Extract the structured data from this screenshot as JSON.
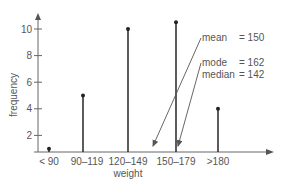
{
  "chart_data": {
    "type": "bar",
    "subtype": "stem",
    "title": "",
    "xlabel": "weight",
    "ylabel": "frequency",
    "categories": [
      "< 90",
      "90–119",
      "120–149",
      "150–179",
      ">180"
    ],
    "values": [
      1,
      5,
      10,
      10.5,
      4
    ],
    "yticks": [
      2,
      4,
      6,
      8,
      10
    ],
    "ylim": [
      0.75,
      11.5
    ],
    "grid": false,
    "legend": null,
    "annotations": [
      {
        "label": "mean",
        "value_text": "= 150",
        "points_to": "between 120–149 and 150–179"
      },
      {
        "label": "mode",
        "value_text": "= 162",
        "points_to": "150–179"
      },
      {
        "label": "median",
        "value_text": "= 142"
      }
    ]
  },
  "colors": {
    "stem": "#333333",
    "axis": "#555555",
    "text": "#555555"
  }
}
